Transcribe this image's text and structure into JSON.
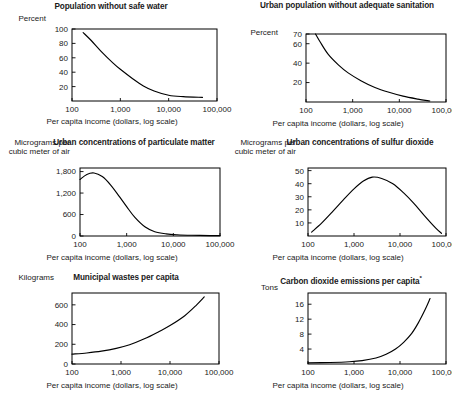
{
  "figure": {
    "axis_caption_shared": "Per capita income (dollars, log scale)",
    "xticks": [
      "100",
      "1,000",
      "10,000",
      "100,000"
    ],
    "xlim_log": [
      2,
      5
    ],
    "line_color": "#000000",
    "frame_color": "#000000",
    "background": "#ffffff"
  },
  "chart_data": [
    {
      "id": "population-without-safe-water",
      "type": "line",
      "title": "Population without safe water",
      "ylabel": "Percent",
      "xlabel": "Per capita income (dollars, log scale)",
      "yticks": [
        100,
        80,
        60,
        40,
        20
      ],
      "ylim": [
        0,
        100
      ],
      "xticks": [
        "100",
        "1,000",
        "10,000",
        "100,000"
      ],
      "xlim": [
        100,
        100000
      ],
      "xscale": "log",
      "grid": false,
      "legend": "none",
      "x": [
        170,
        250,
        400,
        700,
        1000,
        1800,
        3000,
        5000,
        10000,
        20000,
        50000
      ],
      "values": [
        95,
        84,
        69,
        53,
        44,
        31,
        21,
        14,
        8,
        6,
        5
      ]
    },
    {
      "id": "urban-population-without-adequate-sanitation",
      "type": "line",
      "title": "Urban population without\nadequate sanitation",
      "ylabel": "Percent",
      "xlabel": "Per capita income (dollars, log scale)",
      "yticks": [
        70,
        60,
        40,
        20
      ],
      "ylim": [
        0,
        70
      ],
      "xticks": [
        "100",
        "1,000",
        "10,000",
        "100,000"
      ],
      "xlim": [
        100,
        100000
      ],
      "xscale": "log",
      "grid": false,
      "legend": "none",
      "x": [
        160,
        200,
        300,
        500,
        800,
        1500,
        3000,
        6000,
        12000,
        25000,
        45000
      ],
      "values": [
        70,
        62,
        49,
        38,
        30,
        22,
        15,
        10,
        6,
        3,
        1
      ]
    },
    {
      "id": "urban-concentrations-of-particulate-matter",
      "type": "line",
      "title": "Urban concentrations\nof particulate matter",
      "ylabel": "Micrograms per\ncubic meter of air",
      "xlabel": "Per capita income (dollars, log scale)",
      "yticks": [
        1800,
        1200,
        600,
        0
      ],
      "ytick_labels": [
        "1,800",
        "1,200",
        "600",
        "0"
      ],
      "ylim": [
        0,
        1900
      ],
      "xticks": [
        "100",
        "1,000",
        "10,000",
        "100,000"
      ],
      "xlim": [
        100,
        100000
      ],
      "xscale": "log",
      "grid": false,
      "legend": "none",
      "x": [
        100,
        140,
        200,
        300,
        450,
        700,
        1000,
        1500,
        2500,
        4000,
        7000,
        12000,
        25000,
        60000,
        100000
      ],
      "values": [
        1580,
        1720,
        1760,
        1660,
        1430,
        1100,
        820,
        520,
        250,
        120,
        60,
        35,
        20,
        12,
        10
      ]
    },
    {
      "id": "urban-concentrations-of-sulfur-dioxide",
      "type": "line",
      "title": "Urban concentrations\nof sulfur dioxide",
      "ylabel": "Micrograms per\ncubic meter of air",
      "xlabel": "Per capita income (dollars, log scale)",
      "yticks": [
        50,
        40,
        30,
        20,
        10
      ],
      "ylim": [
        0,
        52
      ],
      "xticks": [
        "100",
        "1,000",
        "10,000",
        "100,000"
      ],
      "xlim": [
        100,
        100000
      ],
      "xscale": "log",
      "grid": false,
      "legend": "none",
      "x": [
        120,
        200,
        350,
        600,
        1000,
        1600,
        2500,
        4000,
        7000,
        12000,
        20000,
        35000,
        60000,
        80000
      ],
      "values": [
        3,
        10,
        19,
        28,
        36,
        42,
        45,
        44,
        40,
        33,
        25,
        15,
        6,
        2
      ]
    },
    {
      "id": "municipal-wastes-per-capita",
      "type": "line",
      "title": "Municipal wastes per capita",
      "ylabel": "Kilograms",
      "xlabel": "Per capita income (dollars, log scale)",
      "yticks": [
        600,
        400,
        200,
        0
      ],
      "ylim": [
        0,
        720
      ],
      "xticks": [
        "100",
        "1,000",
        "10,000",
        "100,000"
      ],
      "xlim": [
        100,
        100000
      ],
      "xscale": "log",
      "grid": false,
      "legend": "none",
      "x": [
        100,
        200,
        400,
        800,
        1500,
        3000,
        6000,
        10000,
        20000,
        35000,
        50000
      ],
      "values": [
        100,
        112,
        130,
        158,
        195,
        255,
        330,
        390,
        490,
        600,
        680
      ]
    },
    {
      "id": "carbon-dioxide-emissions-per-capita",
      "type": "line",
      "title": "Carbon dioxide emissions per capita",
      "title_superscript": "*",
      "ylabel": "Tons",
      "xlabel": "Per capita income (dollars, log scale)",
      "yticks": [
        16,
        12,
        8,
        4
      ],
      "ylim": [
        0,
        19
      ],
      "xticks": [
        "100",
        "1,000",
        "10,000",
        "100,000"
      ],
      "xlim": [
        100,
        100000
      ],
      "xscale": "log",
      "grid": false,
      "legend": "none",
      "x": [
        100,
        300,
        800,
        1500,
        3000,
        5000,
        8000,
        12000,
        18000,
        25000,
        35000,
        45000
      ],
      "values": [
        0.3,
        0.4,
        0.6,
        0.9,
        1.6,
        2.6,
        4.0,
        5.8,
        8.2,
        11.0,
        14.5,
        17.5
      ]
    }
  ]
}
